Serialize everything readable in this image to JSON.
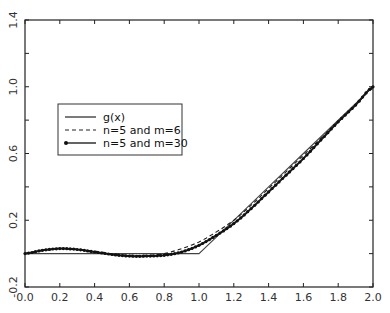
{
  "chart_data": {
    "type": "line",
    "title": "",
    "xlabel": "",
    "ylabel": "",
    "xlim": [
      0.0,
      2.0
    ],
    "ylim": [
      -0.2,
      1.4
    ],
    "grid": false,
    "legend_position": "upper-left (inside, around x=0.15-0.95, y=0.6-0.8)",
    "x_ticks": [
      0.0,
      0.2,
      0.4,
      0.6,
      0.8,
      1.0,
      1.2,
      1.4,
      1.6,
      1.8,
      2.0
    ],
    "x_tick_labels": [
      "0.0",
      "0.2",
      "0.4",
      "0.6",
      "0.8",
      "1.0",
      "1.2",
      "1.4",
      "1.6",
      "1.8",
      "2.0"
    ],
    "y_ticks": [
      -0.2,
      0.2,
      0.6,
      1.0,
      1.4
    ],
    "y_tick_labels": [
      "-0.2",
      "0.2",
      "0.6",
      "1.0",
      "1.4"
    ],
    "series": [
      {
        "name": "g(x)",
        "style": "solid",
        "x": [
          0.0,
          0.2,
          0.4,
          0.6,
          0.8,
          1.0,
          1.2,
          1.4,
          1.6,
          1.8,
          2.0
        ],
        "values": [
          0.0,
          0.0,
          0.0,
          0.0,
          0.0,
          0.0,
          0.2,
          0.4,
          0.6,
          0.8,
          1.0
        ]
      },
      {
        "name": "n=5 and m=6",
        "style": "dashed",
        "x": [
          0.0,
          0.1,
          0.2,
          0.3,
          0.4,
          0.5,
          0.6,
          0.7,
          0.8,
          0.9,
          1.0,
          1.1,
          1.2,
          1.3,
          1.4,
          1.5,
          1.6,
          1.7,
          1.8,
          1.9,
          2.0
        ],
        "values": [
          0.0,
          0.02,
          0.03,
          0.025,
          0.015,
          0.0,
          -0.01,
          -0.01,
          0.0,
          0.03,
          0.07,
          0.13,
          0.2,
          0.29,
          0.39,
          0.49,
          0.59,
          0.69,
          0.79,
          0.89,
          0.99
        ]
      },
      {
        "name": "n=5 and m=30",
        "style": "solid with dot markers",
        "x": [
          0.0,
          0.1,
          0.2,
          0.3,
          0.4,
          0.5,
          0.6,
          0.7,
          0.8,
          0.9,
          1.0,
          1.1,
          1.2,
          1.3,
          1.4,
          1.5,
          1.6,
          1.7,
          1.8,
          1.9,
          2.0
        ],
        "values": [
          0.0,
          0.02,
          0.03,
          0.025,
          0.01,
          -0.005,
          -0.015,
          -0.015,
          -0.01,
          0.01,
          0.05,
          0.11,
          0.18,
          0.27,
          0.37,
          0.47,
          0.57,
          0.68,
          0.79,
          0.89,
          1.0
        ]
      }
    ]
  },
  "legend": {
    "items": [
      {
        "label": "g(x)"
      },
      {
        "label": "n=5 and m=6"
      },
      {
        "label": "n=5 and m=30"
      }
    ]
  }
}
